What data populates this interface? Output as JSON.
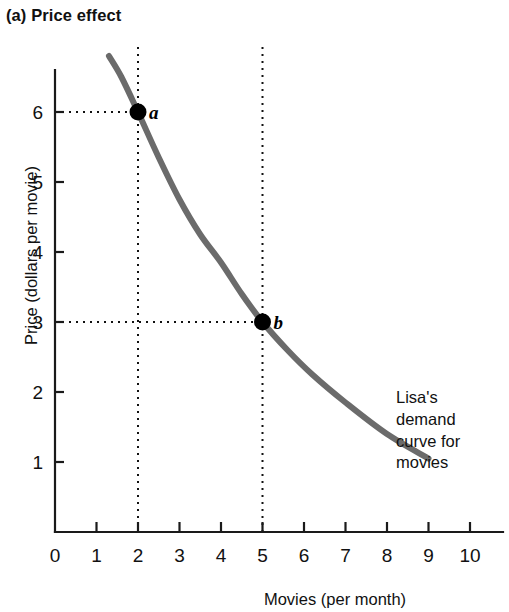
{
  "figure": {
    "panel_label": "(a) Price effect"
  },
  "chart_data": {
    "type": "line",
    "title": "(a) Price effect",
    "xlabel": "Movies (per month)",
    "ylabel": "Price (dollars per movie)",
    "xlim": [
      0,
      10.8
    ],
    "ylim": [
      0,
      6.8
    ],
    "xticks": [
      0,
      1,
      2,
      3,
      4,
      5,
      6,
      7,
      8,
      9,
      10
    ],
    "xtick_labels": [
      "0",
      "1",
      "2",
      "3",
      "4",
      "5",
      "6",
      "7",
      "8",
      "9",
      "10"
    ],
    "yticks": [
      1,
      2,
      3,
      4,
      5,
      6
    ],
    "ytick_labels": [
      "1",
      "2",
      "3",
      "4",
      "5",
      "6"
    ],
    "grid": false,
    "legend": "none",
    "series": [
      {
        "name": "Lisa's demand curve for movies",
        "color": "#6b6b6b",
        "linewidth": 6,
        "x": [
          1.3,
          1.6,
          2.0,
          2.5,
          3.0,
          3.5,
          4.0,
          4.5,
          5.0,
          5.6,
          6.2,
          7.0,
          8.0,
          9.0
        ],
        "y": [
          6.8,
          6.5,
          6.0,
          5.35,
          4.75,
          4.25,
          3.85,
          3.4,
          3.0,
          2.6,
          2.25,
          1.85,
          1.4,
          1.05
        ]
      }
    ],
    "points": [
      {
        "label": "a",
        "x": 2,
        "y": 6
      },
      {
        "label": "b",
        "x": 5,
        "y": 3
      }
    ],
    "guides": [
      {
        "orientation": "vertical",
        "x": 2,
        "from_y": 0,
        "to_y": 7.0
      },
      {
        "orientation": "vertical",
        "x": 5,
        "from_y": 0,
        "to_y": 7.0
      },
      {
        "orientation": "horizontal",
        "y": 6,
        "from_x": 0,
        "to_x": 2
      },
      {
        "orientation": "horizontal",
        "y": 3,
        "from_x": 0,
        "to_x": 5
      }
    ],
    "annotations": [
      {
        "name": "demand-curve-label",
        "text": "Lisa's\ndemand\ncurve for\nmovies",
        "x": 8.2,
        "y": 2.55
      }
    ]
  }
}
